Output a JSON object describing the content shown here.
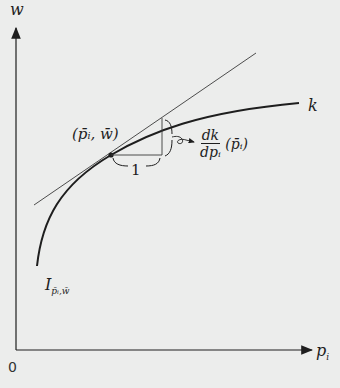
{
  "diagram": {
    "axes": {
      "y_label": "w",
      "x_label_base": "p",
      "x_label_sub": "i",
      "origin_label": "0"
    },
    "curve": {
      "name": "k",
      "bottom_label_base": "I",
      "bottom_label_sub": "p̄ᵢ,w̄"
    },
    "tangent_point": {
      "label": "(p̄ᵢ, w̄)"
    },
    "slope_triangle": {
      "run_label": "1",
      "rise_label_num": "dk",
      "rise_label_den": "dpᵢ",
      "rise_label_arg": "(p̄ᵢ)"
    },
    "colors": {
      "background": "#ecedec",
      "ink": "#1e1e1e",
      "thin_line": "#3a3a3a"
    }
  }
}
